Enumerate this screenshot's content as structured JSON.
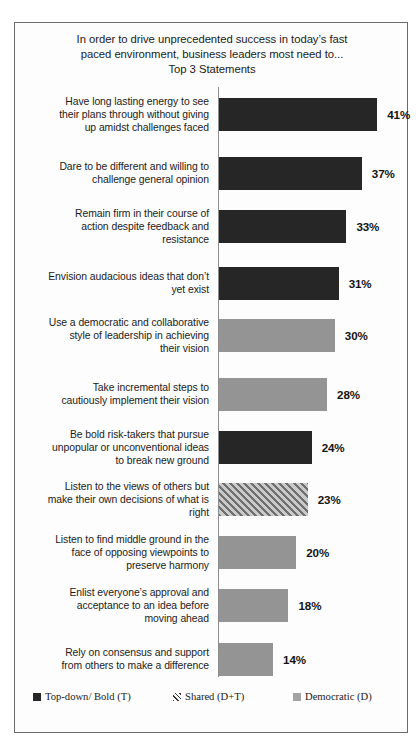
{
  "chart_data": {
    "type": "bar",
    "orientation": "horizontal",
    "title_lines": [
      "In order to drive unprecedented success in today’s fast",
      "paced environment, business leaders most need to...",
      "Top 3 Statements"
    ],
    "xlabel": "",
    "ylabel": "",
    "xlim": [
      0,
      45
    ],
    "grid": false,
    "value_suffix": "%",
    "legend_position": "bottom",
    "categories": [
      "Have long lasting energy to see their plans through without giving up amidst challenges faced",
      "Dare to be different and willing to challenge  general opinion",
      "Remain firm in their course of action despite feedback and resistance",
      "Envision audacious ideas that don’t yet exist",
      "Use a democratic and collaborative style of leadership  in achieving their vision",
      "Take incremental steps to cautiously implement their vision",
      "Be bold risk-takers  that pursue unpopular or unconventional ideas to break new ground",
      "Listen to the views of others but make their own decisions of what is right",
      "Listen to find middle ground in the face of opposing viewpoints  to preserve harmony",
      "Enlist everyone’s approval and acceptance to an idea before moving ahead",
      "Rely on consensus and support from others to make a difference"
    ],
    "values": [
      41,
      37,
      33,
      31,
      30,
      28,
      24,
      23,
      20,
      18,
      14
    ],
    "value_labels": [
      "41%",
      "37%",
      "33%",
      "31%",
      "30%",
      "28%",
      "24%",
      "23%",
      "20%",
      "18%",
      "14%"
    ],
    "point_styles": [
      "T",
      "T",
      "T",
      "T",
      "D",
      "D",
      "T",
      "DT",
      "D",
      "D",
      "D"
    ],
    "legend": [
      {
        "key": "T",
        "label": "Top-down/ Bold (T)"
      },
      {
        "key": "DT",
        "label": "Shared (D+T)"
      },
      {
        "key": "D",
        "label": "Democratic (D)"
      }
    ],
    "colors": {
      "top_down_bold": "#262626",
      "shared": "#9a9a9a",
      "democratic": "#949494",
      "axis": "#8d8d8d",
      "border": "#6b6b6b",
      "background": "#fdfdfd",
      "text": "#1b1b1b"
    }
  },
  "bars": [
    {
      "label_lines": [
        "Have long lasting energy to see",
        "their plans through without giving",
        "up amidst challenges faced"
      ],
      "value_label": "41%",
      "value": 41,
      "style": "T"
    },
    {
      "label_lines": [
        "Dare to be different and willing to",
        "challenge  general opinion"
      ],
      "value_label": "37%",
      "value": 37,
      "style": "T"
    },
    {
      "label_lines": [
        "Remain firm in their course of",
        "action despite feedback and",
        "resistance"
      ],
      "value_label": "33%",
      "value": 33,
      "style": "T"
    },
    {
      "label_lines": [
        "Envision audacious ideas that don’t",
        "yet exist"
      ],
      "value_label": "31%",
      "value": 31,
      "style": "T"
    },
    {
      "label_lines": [
        "Use a democratic and collaborative",
        "style of leadership  in achieving",
        "their vision"
      ],
      "value_label": "30%",
      "value": 30,
      "style": "D"
    },
    {
      "label_lines": [
        "Take incremental steps to",
        "cautiously implement their vision"
      ],
      "value_label": "28%",
      "value": 28,
      "style": "D"
    },
    {
      "label_lines": [
        "Be bold risk-takers  that pursue",
        "unpopular or unconventional ideas",
        "to break new ground"
      ],
      "value_label": "24%",
      "value": 24,
      "style": "T"
    },
    {
      "label_lines": [
        "Listen to the views of others but",
        "make their own decisions of what is",
        "right"
      ],
      "value_label": "23%",
      "value": 23,
      "style": "DT"
    },
    {
      "label_lines": [
        "Listen to find middle ground in the",
        "face of opposing viewpoints  to",
        "preserve harmony"
      ],
      "value_label": "20%",
      "value": 20,
      "style": "D"
    },
    {
      "label_lines": [
        "Enlist everyone’s approval and",
        "acceptance to an idea before",
        "moving ahead"
      ],
      "value_label": "18%",
      "value": 18,
      "style": "D"
    },
    {
      "label_lines": [
        "Rely on consensus and support",
        "from others to make a difference"
      ],
      "value_label": "14%",
      "value": 14,
      "style": "D"
    }
  ]
}
